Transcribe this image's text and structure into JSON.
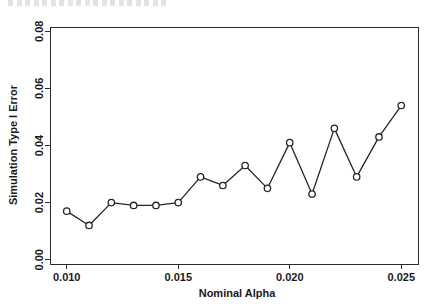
{
  "figure": {
    "top_artifact_text": "",
    "background_color": "#ffffff",
    "frame_color": "#2b2b2b"
  },
  "chart_data": {
    "type": "line",
    "title": "",
    "xlabel": "Nominal Alpha",
    "ylabel": "Simulation Type I Error",
    "xlim": [
      0.00925,
      0.02575
    ],
    "ylim": [
      -0.0015,
      0.0815
    ],
    "grid": false,
    "legend": null,
    "marker": "open-circle",
    "line_color": "#262626",
    "marker_fill": "#ffffff",
    "x": [
      0.01,
      0.011,
      0.012,
      0.013,
      0.014,
      0.015,
      0.016,
      0.017,
      0.018,
      0.019,
      0.02,
      0.021,
      0.022,
      0.023,
      0.024,
      0.025
    ],
    "y": [
      0.017,
      0.012,
      0.02,
      0.019,
      0.019,
      0.02,
      0.029,
      0.026,
      0.033,
      0.025,
      0.041,
      0.023,
      0.046,
      0.029,
      0.043,
      0.054
    ],
    "xticks": [
      0.01,
      0.015,
      0.02,
      0.025
    ],
    "xtick_labels": [
      "0.010",
      "0.015",
      "0.020",
      "0.025"
    ],
    "yticks": [
      0.0,
      0.02,
      0.04,
      0.06,
      0.08
    ],
    "ytick_labels": [
      "0.00",
      "0.02",
      "0.04",
      "0.06",
      "0.08"
    ]
  }
}
